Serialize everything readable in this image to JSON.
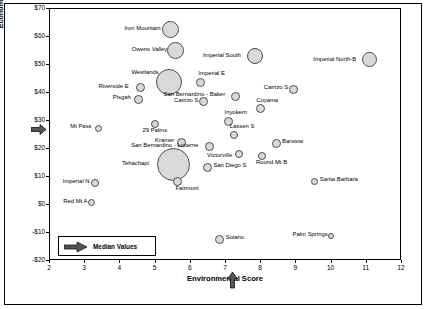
{
  "chart_data": {
    "type": "scatter",
    "title": "",
    "xlabel": "Environmental Score",
    "ylabel": "Economic Ranking Score ($/MWh)",
    "xlim": [
      2,
      12
    ],
    "ylim": [
      -20,
      70
    ],
    "xticks": [
      "2",
      "3",
      "4",
      "5",
      "6",
      "7",
      "8",
      "9",
      "10",
      "11",
      "12"
    ],
    "yticks": [
      "$70",
      "$60",
      "$50",
      "$40",
      "$30",
      "$20",
      "$10",
      "$0",
      "-$10",
      "-$20"
    ],
    "grid": false,
    "legend_position": "lower-left-inside",
    "legend_label": "Median Values",
    "median_x": 7.0,
    "median_y": 26.0,
    "bubble_fill": "#d9d9d9",
    "bubble_stroke": "#4d4d4d",
    "points": [
      {
        "label": "Iron Mountain",
        "x": 5.45,
        "y": 62.5,
        "size": 17
      },
      {
        "label": "Owens Valley",
        "x": 5.6,
        "y": 55.0,
        "size": 17
      },
      {
        "label": "Imperial South",
        "x": 7.85,
        "y": 53.0,
        "size": 16
      },
      {
        "label": "Imperial North-B",
        "x": 11.1,
        "y": 51.5,
        "size": 15
      },
      {
        "label": "Westlands",
        "x": 5.42,
        "y": 43.5,
        "size": 26
      },
      {
        "label": "Imperial E",
        "x": 6.3,
        "y": 43.5,
        "size": 9
      },
      {
        "label": "Riverside E",
        "x": 4.6,
        "y": 41.5,
        "size": 9
      },
      {
        "label": "Carrizo S",
        "x": 8.95,
        "y": 41.0,
        "size": 9
      },
      {
        "label": "San Bernardino - Baker",
        "x": 7.3,
        "y": 38.5,
        "size": 9
      },
      {
        "label": "Pisgah",
        "x": 4.55,
        "y": 37.5,
        "size": 9
      },
      {
        "label": "Carrizo S",
        "x": 6.4,
        "y": 36.5,
        "size": 9
      },
      {
        "label": "Cuyama",
        "x": 8.0,
        "y": 34.0,
        "size": 9
      },
      {
        "label": "Inyokern",
        "x": 7.1,
        "y": 29.5,
        "size": 9
      },
      {
        "label": "29 Palms",
        "x": 5.0,
        "y": 28.5,
        "size": 8
      },
      {
        "label": "Mt Pass",
        "x": 3.4,
        "y": 27.0,
        "size": 7
      },
      {
        "label": "Lassen S",
        "x": 7.25,
        "y": 24.5,
        "size": 8
      },
      {
        "label": "Kramer",
        "x": 5.75,
        "y": 22.0,
        "size": 9
      },
      {
        "label": "San Bernardino - Lucerne",
        "x": 6.55,
        "y": 20.5,
        "size": 9
      },
      {
        "label": "Barstow",
        "x": 8.45,
        "y": 21.5,
        "size": 9
      },
      {
        "label": "Victorville",
        "x": 7.4,
        "y": 18.0,
        "size": 8
      },
      {
        "label": "Round Mt B",
        "x": 8.05,
        "y": 17.0,
        "size": 8
      },
      {
        "label": "Tehachapi",
        "x": 5.55,
        "y": 14.0,
        "size": 33
      },
      {
        "label": "San Diego S",
        "x": 6.5,
        "y": 13.0,
        "size": 9
      },
      {
        "label": "Fairmont",
        "x": 5.65,
        "y": 8.0,
        "size": 9
      },
      {
        "label": "Santa Barbara",
        "x": 9.55,
        "y": 8.0,
        "size": 7
      },
      {
        "label": "Imperial N",
        "x": 3.3,
        "y": 7.5,
        "size": 8
      },
      {
        "label": "Red Mt A",
        "x": 3.2,
        "y": 0.5,
        "size": 7
      },
      {
        "label": "Solano",
        "x": 6.85,
        "y": -12.5,
        "size": 9
      },
      {
        "label": "Palm Springs",
        "x": 10.0,
        "y": -11.5,
        "size": 6
      }
    ]
  },
  "labels": {
    "iron_mountain": "Iron Mountain",
    "owens_valley": "Owens Valley",
    "imperial_south": "Imperial South",
    "imperial_north_b": "Imperial North-B",
    "westlands": "Westlands",
    "imperial_e": "Imperial E",
    "riverside_e": "Riverside E",
    "carrizo_n": "Carrizo N",
    "san_bernardino_baker": "San Bernardino - Baker",
    "pisgah": "Pisgah",
    "carrizo_s": "Carrizo S",
    "cuyama": "Cuyama",
    "inyokern": "Inyokern",
    "palms29": "29 Palms",
    "mt_pass": "Mt Pass",
    "lassen_s": "Lassen S",
    "kramer": "Kramer",
    "san_bernardino_lucerne": "San Bernardino - Lucerne",
    "barstow": "Barstow",
    "victorville": "Victorville",
    "round_mt_b": "Round Mt B",
    "tehachapi": "Tehachapi",
    "san_diego_s": "San Diego S",
    "fairmont": "Fairmont",
    "santa_barbara": "Santa Barbara",
    "imperial_n": "Imperial N",
    "red_mt_a": "Red Mt A",
    "solano": "Solano",
    "palm_springs": "Palm Springs"
  }
}
